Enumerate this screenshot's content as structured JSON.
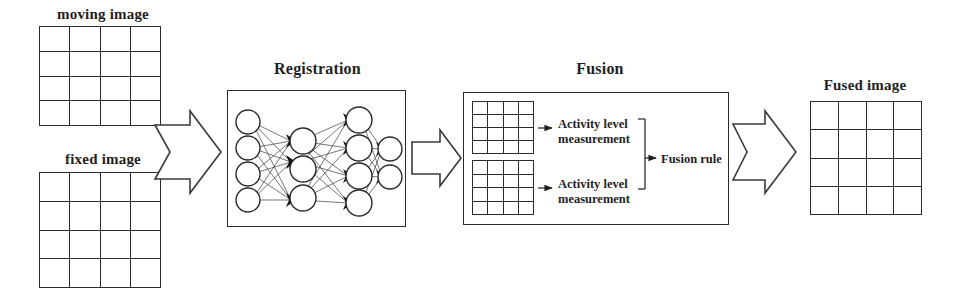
{
  "figure": {
    "type": "pipeline-block-diagram",
    "background_color": "#ffffff",
    "line_color": "#2b2b2b",
    "text_color": "#1f1f1f"
  },
  "inputs": {
    "moving": {
      "caption": "moving image",
      "grid_rows": 4,
      "grid_cols": 4
    },
    "fixed": {
      "caption": "fixed image",
      "grid_rows": 4,
      "grid_cols": 4
    }
  },
  "registration": {
    "title": "Registration",
    "network": {
      "layer_node_counts": [
        4,
        3,
        4,
        2
      ]
    }
  },
  "fusion": {
    "title": "Fusion",
    "grids": [
      {
        "grid_rows": 4,
        "grid_cols": 4
      },
      {
        "grid_rows": 4,
        "grid_cols": 4
      }
    ],
    "activity_top": "Activity level measurement",
    "activity_bottom": "Activity level measurement",
    "rule": "Fusion rule"
  },
  "output": {
    "caption": "Fused image",
    "grid_rows": 4,
    "grid_cols": 4
  },
  "arrows": {
    "input_to_registration": "block-arrow-notched-right",
    "registration_to_fusion": "block-arrow-right",
    "fusion_to_output": "block-arrow-notched-right"
  }
}
